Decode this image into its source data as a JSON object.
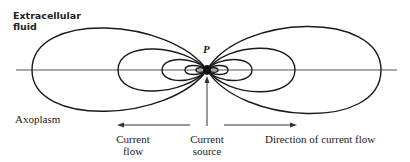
{
  "figure": {
    "labels": {
      "extracellular": [
        "Extracellular",
        "fluid"
      ],
      "axoplasm": "Axoplasm",
      "point": "P",
      "current_flow": [
        "Current",
        "flow"
      ],
      "current_source": [
        "Current",
        "source"
      ],
      "direction": "Direction of current flow"
    },
    "geometry": {
      "axis_y": 70,
      "axis_x_range": [
        16,
        397
      ],
      "center_x": 207,
      "left_loops_leftmost_x": [
        32,
        118,
        162,
        185
      ],
      "right_loops_rightmost_x": [
        381,
        295,
        252,
        228
      ],
      "arrows_y": 125
    },
    "colors": {
      "line": "#1a1a1a",
      "axis": "#555555",
      "background": "#ffffff"
    }
  }
}
